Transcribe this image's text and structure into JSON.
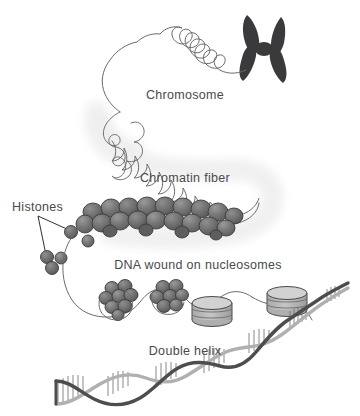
{
  "diagram": {
    "background_color": "#ffffff",
    "labels": [
      {
        "id": "chromosome",
        "text": "Chromosome",
        "x": 185,
        "y": 99,
        "size": 12.5,
        "anchor": "middle"
      },
      {
        "id": "chromatin",
        "text": "Chromatin fiber",
        "x": 185,
        "y": 182,
        "size": 12.5,
        "anchor": "middle"
      },
      {
        "id": "histones",
        "text": "Histones",
        "x": 12,
        "y": 211,
        "size": 12.5,
        "anchor": "start"
      },
      {
        "id": "nucleosomes",
        "text": "DNA wound on nucleosomes",
        "x": 198,
        "y": 269,
        "size": 12.5,
        "anchor": "middle"
      },
      {
        "id": "helix",
        "text": "Double helix",
        "x": 185,
        "y": 355,
        "size": 12.5,
        "anchor": "middle"
      }
    ],
    "colors": {
      "chromosome_fill": "#3a3a3c",
      "line_stroke": "#6b6b6b",
      "sphere_fill": "#6e6e6e",
      "sphere_dark": "#5a5a5a",
      "sphere_light": "#8a8a8a",
      "sphere_stroke": "#3c3c3c",
      "disc_fill": "#b9b9b9",
      "disc_top": "#d2d2d2",
      "disc_stroke": "#4a4a4a",
      "shadow": "#efefef",
      "helix_dark": "#4d4d4d",
      "helix_light": "#b0b0b0",
      "label_color": "#4a4a4a"
    },
    "structures": [
      {
        "name": "metaphase-chromosome",
        "shape": "x-shaped",
        "count": 1
      },
      {
        "name": "chromosome-loop-outline",
        "shape": "wavy-closed-loop",
        "count": 1
      },
      {
        "name": "chromatin-squiggle",
        "shape": "zigzag-wave",
        "count": 1
      },
      {
        "name": "chromatin-fiber-bead-mass",
        "shape": "packed-sphere-cluster",
        "count": 30
      },
      {
        "name": "free-histone-spheres",
        "shape": "sphere",
        "count": 6
      },
      {
        "name": "nucleosome-bead-cluster",
        "shape": "sphere-cluster",
        "count": 2
      },
      {
        "name": "nucleosome-disc-stack",
        "shape": "stacked-cylinder",
        "count": 2
      },
      {
        "name": "dna-double-helix",
        "shape": "twisted-ladder",
        "count": 1
      }
    ]
  }
}
